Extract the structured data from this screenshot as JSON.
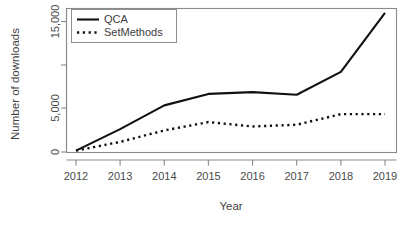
{
  "chart_data": {
    "type": "line",
    "title": "",
    "xlabel": "Year",
    "ylabel": "Number of downloads",
    "x": [
      2012,
      2013,
      2014,
      2015,
      2016,
      2017,
      2018,
      2019
    ],
    "xlim": [
      2012,
      2019
    ],
    "ylim": [
      0,
      16500
    ],
    "grid": false,
    "legend_position": "top-left",
    "x_tick_labels": [
      "2012",
      "2013",
      "2014",
      "2015",
      "2016",
      "2017",
      "2018",
      "2019"
    ],
    "y_tick_values": [
      0,
      5000,
      10000,
      15000,
      20000
    ],
    "y_tick_labels": [
      "0",
      "5,000",
      "",
      "15,000",
      ""
    ],
    "y_labeled_ticks": [
      "0",
      "5,000",
      "15,000"
    ],
    "series": [
      {
        "name": "QCA",
        "style": "solid",
        "color": "#111111",
        "values": [
          150,
          2600,
          5300,
          6600,
          6800,
          6500,
          9100,
          15800
        ]
      },
      {
        "name": "SetMethods",
        "style": "dotted",
        "color": "#111111",
        "values": [
          150,
          1150,
          2450,
          3400,
          2900,
          3100,
          4300,
          4300
        ]
      }
    ]
  },
  "legend": {
    "entries": [
      {
        "label": "QCA",
        "style": "solid"
      },
      {
        "label": "SetMethods",
        "style": "dotted"
      }
    ]
  },
  "axes": {
    "x_title": "Year",
    "y_title": "Number of downloads"
  }
}
